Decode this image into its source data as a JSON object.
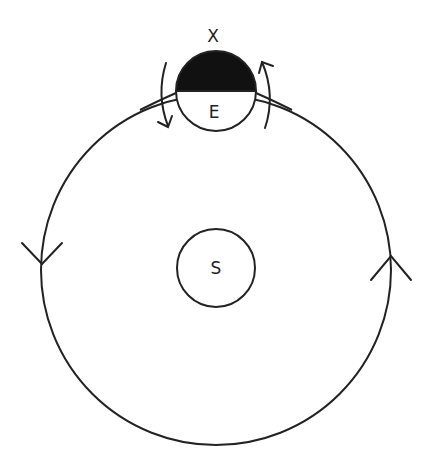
{
  "diagram": {
    "type": "orbit-diagram",
    "labels": {
      "sun": "S",
      "earth": "E",
      "marker": "X"
    },
    "colors": {
      "stroke": "#222222",
      "fill_dark": "#111111",
      "background": "#ffffff"
    },
    "elements": {
      "orbit": {
        "cx": 216,
        "cy": 270,
        "r": 175,
        "direction": "counter-clockwise"
      },
      "sun": {
        "cx": 216,
        "cy": 268,
        "r": 39
      },
      "earth": {
        "cx": 216,
        "cy": 91,
        "r": 40,
        "top_half_shaded": true
      },
      "rotation_arrows": [
        "left-arc-down",
        "right-arc-up"
      ],
      "orbit_arrows": [
        "left-arrow-down",
        "right-arrow-up"
      ]
    }
  }
}
